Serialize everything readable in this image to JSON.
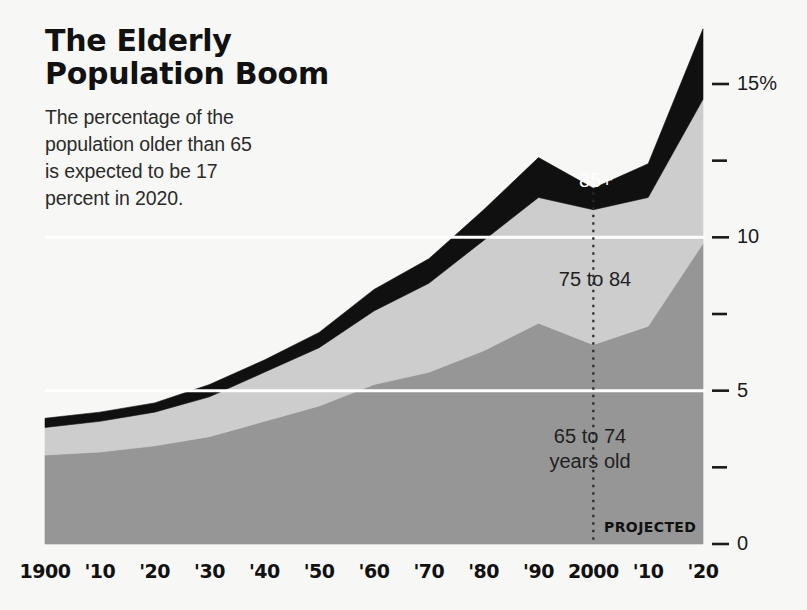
{
  "header": {
    "title_lines": [
      "The Elderly",
      "Population Boom"
    ],
    "subtitle_lines": [
      "The percentage of the",
      "population older than 65",
      "is expected to be 17",
      "percent in 2020."
    ]
  },
  "annotations": {
    "projected_label": "PROJECTED",
    "band_85plus": "85+",
    "band_75to84": "75 to 84",
    "band_65to74_line1": "65 to 74",
    "band_65to74_line2": "years old"
  },
  "colors": {
    "background": "#f7f7f5",
    "band_65to74": "#969696",
    "band_75to84": "#cdcdcd",
    "band_85plus": "#101010",
    "gridline": "#ffffff",
    "axis_text": "#1a1a1a",
    "label_light": "#ffffff",
    "label_dark": "#1f1f1f"
  },
  "chart_data": {
    "type": "area",
    "title": "The Elderly Population Boom",
    "subtitle": "The percentage of the population older than 65 is expected to be 17 percent in 2020.",
    "xlabel": "",
    "ylabel": "",
    "stacked": true,
    "grid": true,
    "legend_position": "inline-labels",
    "x": [
      1900,
      1910,
      1920,
      1930,
      1940,
      1950,
      1960,
      1970,
      1980,
      1990,
      2000,
      2010,
      2020
    ],
    "xtick_labels": [
      "1900",
      "'10",
      "'20",
      "'30",
      "'40",
      "'50",
      "'60",
      "'70",
      "'80",
      "'90",
      "2000",
      "'10",
      "'20"
    ],
    "xlim": [
      1900,
      2020
    ],
    "ylim": [
      0,
      17.5
    ],
    "ytick_values": [
      0,
      2.5,
      5,
      7.5,
      10,
      12.5,
      15
    ],
    "ytick_labels": [
      "0",
      "",
      "5",
      "",
      "10",
      "",
      "15%"
    ],
    "projected_from": 2000,
    "series": [
      {
        "name": "65 to 74 years old",
        "color": "#969696",
        "values": [
          2.9,
          3.0,
          3.2,
          3.5,
          4.0,
          4.5,
          5.2,
          5.6,
          6.3,
          7.2,
          6.5,
          7.1,
          9.8
        ]
      },
      {
        "name": "75 to 84",
        "color": "#cdcdcd",
        "values": [
          0.9,
          1.0,
          1.1,
          1.3,
          1.6,
          1.9,
          2.4,
          2.9,
          3.6,
          4.1,
          4.4,
          4.2,
          4.7
        ]
      },
      {
        "name": "85+",
        "color": "#101010",
        "values": [
          0.3,
          0.3,
          0.3,
          0.4,
          0.4,
          0.5,
          0.7,
          0.8,
          1.0,
          1.3,
          0.7,
          1.1,
          2.3
        ]
      }
    ],
    "totals": [
      4.1,
      4.3,
      4.6,
      5.2,
      6.0,
      6.9,
      8.3,
      9.3,
      10.9,
      12.6,
      11.6,
      12.4,
      16.8
    ]
  }
}
